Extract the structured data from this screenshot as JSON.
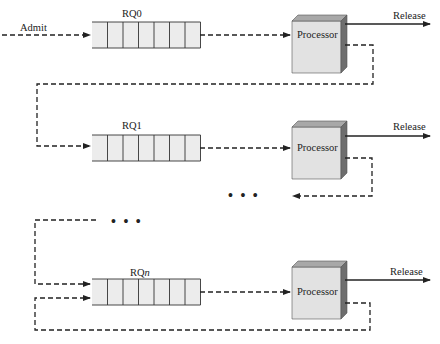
{
  "diagram": {
    "admit_label": "Admit",
    "queues": [
      {
        "id": "rq0",
        "label": "RQ0",
        "label_suffix": ""
      },
      {
        "id": "rq1",
        "label": "RQ1",
        "label_suffix": ""
      },
      {
        "id": "rqn",
        "label": "RQ",
        "label_suffix": "n"
      }
    ],
    "processor_label": "Processor",
    "release_label": "Release",
    "ellipsis": "• • •",
    "cells_per_queue": 7,
    "colors": {
      "queue_fill": "#ececec",
      "processor_front": "#e2e2e2",
      "processor_top": "#a8a8a8",
      "processor_side": "#6e6e6e",
      "line": "#222222"
    }
  }
}
